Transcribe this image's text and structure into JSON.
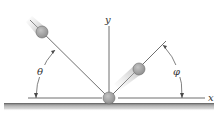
{
  "diagram": {
    "axes": {
      "x_label": "x",
      "y_label": "y"
    },
    "angles": {
      "incident_label": "θ",
      "reflected_label": "φ"
    },
    "colors": {
      "ball_fill": "#a8a8a8",
      "ball_stroke": "#6e6e6e",
      "line": "#4a4a4a",
      "ground_dark": "#7a7a7a",
      "ground_light": "#cfcfcf",
      "label": "#333333"
    },
    "elements": {
      "incoming_ball": "ball approaching surface",
      "contact_ball": "ball at impact point",
      "outgoing_ball": "ball rebounding from surface",
      "surface": "horizontal ground surface"
    }
  }
}
